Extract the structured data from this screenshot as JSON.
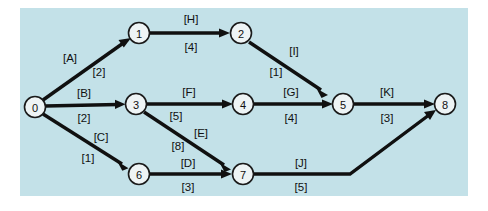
{
  "figure": {
    "kind": "activity-on-arc network diagram",
    "background_color": "#ffffff",
    "panel_color": "#c3e1e8",
    "ink_color": "#101010",
    "node_fill_color": "#eef4f5"
  },
  "nodes": [
    {
      "id": "n0",
      "label": "0",
      "cx": 35,
      "cy": 107,
      "r": 10.5
    },
    {
      "id": "n1",
      "label": "1",
      "cx": 139,
      "cy": 33,
      "r": 10.5
    },
    {
      "id": "n2",
      "label": "2",
      "cx": 241,
      "cy": 33,
      "r": 10.5
    },
    {
      "id": "n3",
      "label": "3",
      "cx": 136,
      "cy": 104,
      "r": 10.5
    },
    {
      "id": "n4",
      "label": "4",
      "cx": 243,
      "cy": 104,
      "r": 10.5
    },
    {
      "id": "n5",
      "label": "5",
      "cx": 343,
      "cy": 104,
      "r": 10.5
    },
    {
      "id": "n6",
      "label": "6",
      "cx": 139,
      "cy": 174,
      "r": 10.5
    },
    {
      "id": "n7",
      "label": "7",
      "cx": 243,
      "cy": 174,
      "r": 10.5
    },
    {
      "id": "n8",
      "label": "8",
      "cx": 445,
      "cy": 104,
      "r": 10.5
    }
  ],
  "edges": [
    {
      "id": "e-A",
      "from": "0",
      "to": "1",
      "name": "[A]",
      "weight": "[2]",
      "name_x": 70,
      "name_y": 58,
      "weight_x": 99,
      "weight_y": 72
    },
    {
      "id": "e-B",
      "from": "0",
      "to": "3",
      "name": "[B]",
      "weight": "[2]",
      "name_x": 84,
      "name_y": 93,
      "weight_x": 84,
      "weight_y": 118
    },
    {
      "id": "e-C",
      "from": "0",
      "to": "6",
      "name": "[C]",
      "weight": "[1]",
      "name_x": 101,
      "name_y": 137,
      "weight_x": 88,
      "weight_y": 158
    },
    {
      "id": "e-H",
      "from": "1",
      "to": "2",
      "name": "[H]",
      "weight": "[4]",
      "name_x": 191,
      "name_y": 19,
      "weight_x": 191,
      "weight_y": 47
    },
    {
      "id": "e-I",
      "from": "2",
      "to": "5",
      "name": "[I]",
      "weight": "[1]",
      "name_x": 294,
      "name_y": 51,
      "weight_x": 276,
      "weight_y": 72
    },
    {
      "id": "e-F",
      "from": "3",
      "to": "4",
      "name": "[F]",
      "weight": "[5]",
      "name_x": 189,
      "name_y": 92,
      "weight_x": 176,
      "weight_y": 116
    },
    {
      "id": "e-E",
      "from": "3",
      "to": "7",
      "name": "[E]",
      "weight": "[8]",
      "name_x": 201,
      "name_y": 133,
      "weight_x": 178,
      "weight_y": 146
    },
    {
      "id": "e-G",
      "from": "4",
      "to": "5",
      "name": "[G]",
      "weight": "[4]",
      "name_x": 291,
      "name_y": 92,
      "weight_x": 291,
      "weight_y": 118
    },
    {
      "id": "e-D",
      "from": "6",
      "to": "7",
      "name": "[D]",
      "weight": "[3]",
      "name_x": 188,
      "name_y": 163,
      "weight_x": 188,
      "weight_y": 187
    },
    {
      "id": "e-K",
      "from": "5",
      "to": "8",
      "name": "[K]",
      "weight": "[3]",
      "name_x": 387,
      "name_y": 92,
      "weight_x": 387,
      "weight_y": 118
    },
    {
      "id": "e-J",
      "from": "7",
      "to": "8",
      "name": "[J]",
      "weight": "[5]",
      "name_x": 301,
      "name_y": 163,
      "weight_x": 301,
      "weight_y": 187
    }
  ]
}
